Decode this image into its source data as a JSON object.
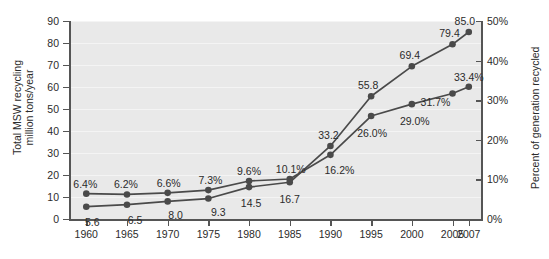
{
  "chart_data": {
    "type": "line",
    "title": "",
    "xlabel": "",
    "ylabel": "Total MSW recycling\nmillion tons/year",
    "ylabel_right": "Percent of generation recycled",
    "x": [
      1960,
      1965,
      1970,
      1975,
      1980,
      1985,
      1990,
      1995,
      2000,
      2005,
      2007
    ],
    "xlim": [
      1958,
      2008.5
    ],
    "xticks": [
      "1960",
      "1965",
      "1970",
      "1975",
      "1980",
      "1985",
      "1990",
      "1995",
      "2000",
      "2005",
      "2007"
    ],
    "ylim": [
      0,
      90
    ],
    "yticks": [
      "0",
      "10",
      "20",
      "30",
      "40",
      "50",
      "60",
      "70",
      "80",
      "90"
    ],
    "ylim_right": [
      0,
      50
    ],
    "yticks_right": [
      "0%",
      "10%",
      "20%",
      "30%",
      "40%",
      "50%"
    ],
    "grid": true,
    "legend_position": "none",
    "series": [
      {
        "name": "Total MSW recycling (million tons/year)",
        "axis": "left",
        "color": "#4a4a4a",
        "marker": "circle",
        "values": [
          5.6,
          6.5,
          8.0,
          9.3,
          14.5,
          16.7,
          33.2,
          55.8,
          69.4,
          79.4,
          85.0
        ],
        "labels": [
          "5.6",
          "6.5",
          "8.0",
          "9.3",
          "14.5",
          "16.7",
          "33.2",
          "55.8",
          "69.4",
          "79.4",
          "85.0"
        ]
      },
      {
        "name": "Percent of generation recycled",
        "axis": "right",
        "color": "#4a4a4a",
        "marker": "circle",
        "values": [
          6.4,
          6.2,
          6.6,
          7.3,
          9.6,
          10.1,
          16.2,
          26.0,
          29.0,
          31.7,
          33.4
        ],
        "labels": [
          "6.4%",
          "6.2%",
          "6.6%",
          "7.3%",
          "9.6%",
          "10.1%",
          "16.2%",
          "26.0%",
          "29.0%",
          "31.7%",
          "33.4%"
        ]
      }
    ],
    "colors": {
      "plot_background": "#e9e9e9",
      "gridline": "#f4f4f4",
      "axis": "#555555",
      "series": "#4a4a4a",
      "text": "#2b2b2b",
      "page_background": "#ffffff"
    }
  }
}
